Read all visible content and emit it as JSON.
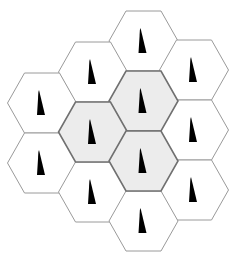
{
  "diagram": {
    "title": "Hexagonal cellular network layout with directional antenna markers",
    "colors": {
      "background": "#ffffff",
      "cell_fill": "#ffffff",
      "cell_stroke": "#9a9a9a",
      "shaded_fill": "#ececec",
      "shaded_stroke": "#707070",
      "marker": "#000000"
    },
    "hex_geometry": {
      "orientation": "flat-top",
      "half_width": 34.5,
      "half_height": 30,
      "top_edge_half_length": 17.5
    },
    "cells": [
      {
        "id": "cell-col2-row0",
        "cx": 143.5,
        "cy": 41,
        "shaded": false,
        "marker": "antenna"
      },
      {
        "id": "cell-col1-row0",
        "cx": 93,
        "cy": 72,
        "shaded": false,
        "marker": "antenna"
      },
      {
        "id": "cell-col3-row0",
        "cx": 194,
        "cy": 70,
        "shaded": false,
        "marker": "antenna"
      },
      {
        "id": "cell-col0-row0",
        "cx": 42,
        "cy": 103,
        "shaded": false,
        "marker": "antenna"
      },
      {
        "id": "cell-col2-row1",
        "cx": 143.5,
        "cy": 101,
        "shaded": true,
        "marker": "antenna"
      },
      {
        "id": "cell-col1-row1",
        "cx": 93,
        "cy": 132,
        "shaded": true,
        "marker": "antenna"
      },
      {
        "id": "cell-col3-row1",
        "cx": 194,
        "cy": 130,
        "shaded": false,
        "marker": "antenna"
      },
      {
        "id": "cell-col0-row1",
        "cx": 42,
        "cy": 163,
        "shaded": false,
        "marker": "antenna"
      },
      {
        "id": "cell-col2-row2",
        "cx": 143.5,
        "cy": 161,
        "shaded": true,
        "marker": "antenna"
      },
      {
        "id": "cell-col1-row2",
        "cx": 93,
        "cy": 192,
        "shaded": false,
        "marker": "antenna"
      },
      {
        "id": "cell-col3-row2",
        "cx": 194,
        "cy": 190,
        "shaded": false,
        "marker": "antenna"
      },
      {
        "id": "cell-col2-row3",
        "cx": 143.5,
        "cy": 221,
        "shaded": false,
        "marker": "antenna"
      }
    ],
    "marker_shape": {
      "name": "antenna-spike-icon",
      "description": "narrow black triangle, vertical left edge, apex at top",
      "apex_dx": -3,
      "apex_dy": -13,
      "base_left_dx": -5,
      "base_right_dx": 3,
      "base_dy": 12
    },
    "shaded_cluster_count": 3,
    "total_cells": 12
  }
}
